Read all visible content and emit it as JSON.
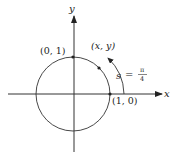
{
  "diagram": {
    "type": "unit-circle",
    "axes": {
      "x_label": "x",
      "y_label": "y"
    },
    "points": [
      {
        "label": "(0, 1)",
        "coords": [
          0,
          1
        ]
      },
      {
        "label": "(1, 0)",
        "coords": [
          1,
          0
        ]
      },
      {
        "label": "(x, y)",
        "angle": "π/4"
      }
    ],
    "arc_label": {
      "variable": "s",
      "equals": "=",
      "numerator": "π",
      "denominator": "4"
    },
    "colors": {
      "stroke": "#333333",
      "background": "#ffffff"
    }
  }
}
